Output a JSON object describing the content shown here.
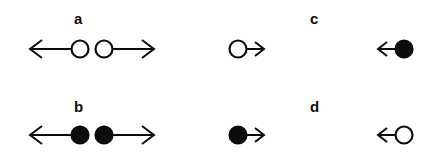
{
  "figure": {
    "background_color": "#ffffff",
    "ink_color": "#0d0d0d",
    "width": 427,
    "height": 163
  },
  "panels": [
    {
      "id": "a",
      "label": "a",
      "label_x": 74,
      "label_y": 11,
      "row": "top",
      "side": "left",
      "description": "pair of open circles moving apart",
      "symbols": [
        {
          "name": "open-circle-left-arrow",
          "particle": "open-circle",
          "arrow_direction": "left",
          "arrow_length": 44,
          "x": 22,
          "y": 36,
          "circle_r": 9
        },
        {
          "name": "open-circle-right-arrow",
          "particle": "open-circle",
          "arrow_direction": "right",
          "arrow_length": 44,
          "x": 92,
          "y": 36,
          "circle_r": 9
        }
      ]
    },
    {
      "id": "b",
      "label": "b",
      "label_x": 74,
      "label_y": 99,
      "row": "bottom",
      "side": "left",
      "description": "pair of filled circles moving apart",
      "symbols": [
        {
          "name": "filled-circle-left-arrow",
          "particle": "filled-circle",
          "arrow_direction": "left",
          "arrow_length": 44,
          "x": 22,
          "y": 122,
          "circle_r": 9
        },
        {
          "name": "filled-circle-right-arrow",
          "particle": "filled-circle",
          "arrow_direction": "right",
          "arrow_length": 44,
          "x": 92,
          "y": 122,
          "circle_r": 9
        }
      ]
    },
    {
      "id": "c",
      "label": "c",
      "label_x": 310,
      "label_y": 11,
      "row": "top",
      "side": "right",
      "description": "single open circle moving right and single filled circle moving left",
      "symbols": [
        {
          "name": "open-circle-short-right-arrow",
          "particle": "open-circle",
          "arrow_direction": "right",
          "arrow_length": 20,
          "x": 226,
          "y": 36,
          "circle_r": 9
        },
        {
          "name": "filled-circle-short-left-arrow",
          "particle": "filled-circle",
          "arrow_direction": "left",
          "arrow_length": 20,
          "x": 370,
          "y": 36,
          "circle_r": 9
        }
      ]
    },
    {
      "id": "d",
      "label": "d",
      "label_x": 310,
      "label_y": 99,
      "row": "bottom",
      "side": "right",
      "description": "single filled circle moving right and single open circle moving left",
      "symbols": [
        {
          "name": "filled-circle-short-right-arrow",
          "particle": "filled-circle",
          "arrow_direction": "right",
          "arrow_length": 20,
          "x": 226,
          "y": 122,
          "circle_r": 9
        },
        {
          "name": "open-circle-short-left-arrow",
          "particle": "open-circle",
          "arrow_direction": "left",
          "arrow_length": 20,
          "x": 370,
          "y": 122,
          "circle_r": 9
        }
      ]
    }
  ]
}
